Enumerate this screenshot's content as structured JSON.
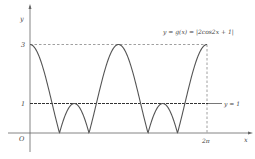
{
  "chart_data": {
    "type": "line",
    "title": "",
    "function_label": "y = g(x) = |2cos2x + 1|",
    "reference_line_label": "y = 1",
    "xlabel": "x",
    "ylabel": "y",
    "origin_label": "O",
    "x_tick_labels": [
      "2π"
    ],
    "y_tick_labels": [
      "1",
      "3"
    ],
    "xlim": [
      0,
      6.2832
    ],
    "ylim": [
      0,
      3
    ],
    "grid": false,
    "series": [
      {
        "name": "y = |2cos2x + 1|",
        "x": [
          0,
          0.5236,
          1.0472,
          1.5708,
          2.0944,
          2.618,
          3.1416,
          3.6652,
          4.1888,
          4.7124,
          5.236,
          5.7596,
          6.2832
        ],
        "values": [
          3,
          2,
          0,
          1,
          0,
          2,
          3,
          2,
          0,
          1,
          0,
          2,
          3
        ]
      },
      {
        "name": "y = 1",
        "x": [
          0,
          6.2832
        ],
        "values": [
          1,
          1
        ]
      }
    ],
    "annotations": [
      "dashed line y = 3 from x = 0 to 2π",
      "dashed vertical line at x = 2π from y = 0 to 3"
    ]
  },
  "labels": {
    "function": "y = g(x) = |2cos2x + 1|",
    "ref_line": "y = 1",
    "x_axis": "x",
    "y_axis": "y",
    "origin": "O",
    "tick_2pi": "2π",
    "tick_1": "1",
    "tick_3": "3"
  },
  "colors": {
    "curve": "#555555",
    "axis": "#666666",
    "dashed": "#777777",
    "ref_line": "#333333"
  }
}
